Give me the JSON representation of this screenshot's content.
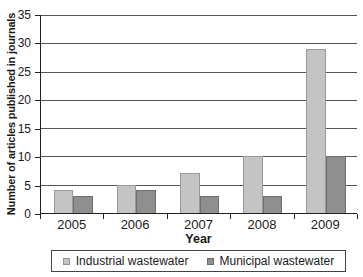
{
  "chart_data": {
    "type": "bar",
    "title": "",
    "xlabel": "Year",
    "ylabel": "Number of articles published in journals",
    "categories": [
      "2005",
      "2006",
      "2007",
      "2008",
      "2009"
    ],
    "series": [
      {
        "name": "Industrial wastewater",
        "color": "#c4c4c4",
        "values": [
          4,
          5,
          7,
          10,
          29
        ]
      },
      {
        "name": "Municipal wastewater",
        "color": "#8f8f8f",
        "values": [
          3,
          4,
          3,
          3,
          10
        ]
      }
    ],
    "ylim": [
      0,
      35
    ],
    "ytick_step": 5,
    "grid": "horizontal",
    "legend_position": "bottom"
  },
  "colors": {
    "gridline": "#565656",
    "axis": "#222222",
    "text": "#1a1a1a",
    "background": "#ffffff",
    "legend_border": "#444444"
  }
}
